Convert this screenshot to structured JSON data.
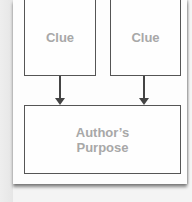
{
  "diagram": {
    "nodes": [
      {
        "id": "clue-1",
        "label": "Clue"
      },
      {
        "id": "clue-2",
        "label": "Clue"
      },
      {
        "id": "authors-purpose",
        "label": "Author’s Purpose"
      }
    ],
    "edges": [
      {
        "from": "clue-1",
        "to": "authors-purpose"
      },
      {
        "from": "clue-2",
        "to": "authors-purpose"
      }
    ],
    "colors": {
      "border": "#555555",
      "text": "#a8a8a8",
      "arrow": "#444444"
    }
  }
}
